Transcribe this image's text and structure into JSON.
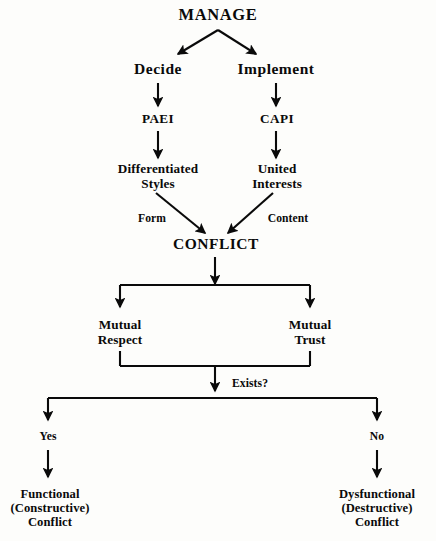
{
  "diagram": {
    "title": "MANAGE",
    "style": {
      "background_color": "#fdfdfb",
      "ink_color": "#0a0a0a"
    },
    "nodes": {
      "root": {
        "label": "MANAGE"
      },
      "decide": {
        "label": "Decide"
      },
      "implement": {
        "label": "Implement"
      },
      "paei": {
        "label": "PAEI"
      },
      "capi": {
        "label": "CAPI"
      },
      "differentiated_styles": {
        "line1": "Differentiated",
        "line2": "Styles"
      },
      "united_interests": {
        "line1": "United",
        "line2": "Interests"
      },
      "conflict": {
        "label": "CONFLICT"
      },
      "mutual_respect": {
        "line1": "Mutual",
        "line2": "Respect"
      },
      "mutual_trust": {
        "line1": "Mutual",
        "line2": "Trust"
      },
      "functional_conflict": {
        "line1": "Functional",
        "line2": "(Constructive)",
        "line3": "Conflict"
      },
      "dysfunctional_conflict": {
        "line1": "Dysfunctional",
        "line2": "(Destructive)",
        "line3": "Conflict"
      }
    },
    "edge_labels": {
      "form": "Form",
      "content": "Content",
      "exists": "Exists?",
      "yes": "Yes",
      "no": "No"
    }
  }
}
